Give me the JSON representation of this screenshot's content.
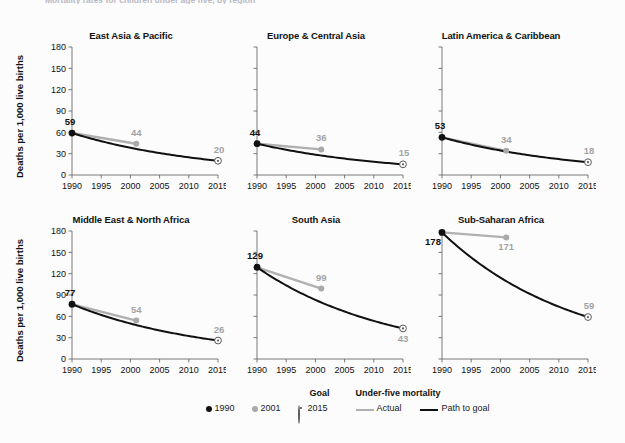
{
  "caption": {
    "partial_text": "Mortality rates for children under age five, by region"
  },
  "axes": {
    "ylabel": "Deaths per 1,000 live births",
    "yticks": [
      "0",
      "30",
      "60",
      "90",
      "120",
      "150",
      "180"
    ],
    "xticks": [
      "1990",
      "1995",
      "2000",
      "2005",
      "2010",
      "2015"
    ],
    "ymin": 0,
    "ymax": 180,
    "xmin": 1990,
    "xmax": 2015
  },
  "legend": {
    "goal_header": "Goal",
    "series_header": "Under-five mortality",
    "marker_1990": "1990",
    "marker_2001": "2001",
    "marker_2015": "2015",
    "line_actual": "Actual",
    "line_path": "Path to goal"
  },
  "colors": {
    "actual": "#b0b0b0",
    "path": "#111111",
    "marker_1990": "#111111",
    "marker_2001": "#a9a9a9",
    "marker_2015": "#5a5a5a",
    "label_gray": "#a3a3a3",
    "label_black": "#111111",
    "axis": "#6b6b6b",
    "background": "#fcfcfc"
  },
  "chart_data": {
    "type": "line",
    "title": "Mortality rates for children under age five, by region",
    "xlabel": "",
    "ylabel": "Deaths per 1,000 live births",
    "xlim": [
      1990,
      2015
    ],
    "ylim": [
      0,
      180
    ],
    "yticks": [
      0,
      30,
      60,
      90,
      120,
      150,
      180
    ],
    "xticks": [
      1990,
      1995,
      2000,
      2005,
      2010,
      2015
    ],
    "grid": false,
    "legend_position": "bottom-center",
    "small_multiples": true,
    "panel_layout": [
      2,
      3
    ],
    "series_definitions": [
      {
        "name": "Actual",
        "color": "#b0b0b0",
        "years": [
          1990,
          2001
        ]
      },
      {
        "name": "Path to goal",
        "color": "#111111",
        "years": [
          1990,
          2015
        ]
      }
    ],
    "marker_definitions": [
      {
        "name": "1990",
        "color": "#111111",
        "style": "filled-circle"
      },
      {
        "name": "2001",
        "color": "#a9a9a9",
        "style": "filled-circle"
      },
      {
        "name": "2015",
        "color": "#5a5a5a",
        "style": "goal-circle"
      }
    ],
    "panels": [
      {
        "title": "East Asia & Pacific",
        "points": [
          {
            "year": 1990,
            "value": 59,
            "label": "59",
            "label_pos": "above-left",
            "marker": "1990"
          },
          {
            "year": 2001,
            "value": 44,
            "label": "44",
            "label_pos": "above",
            "marker": "2001"
          },
          {
            "year": 2015,
            "value": 20,
            "label": "20",
            "label_pos": "above-right",
            "marker": "2015"
          }
        ]
      },
      {
        "title": "Europe & Central Asia",
        "points": [
          {
            "year": 1990,
            "value": 44,
            "label": "44",
            "label_pos": "above-left",
            "marker": "1990"
          },
          {
            "year": 2001,
            "value": 36,
            "label": "36",
            "label_pos": "above",
            "marker": "2001"
          },
          {
            "year": 2015,
            "value": 15,
            "label": "15",
            "label_pos": "above-right",
            "marker": "2015"
          }
        ]
      },
      {
        "title": "Latin America & Caribbean",
        "points": [
          {
            "year": 1990,
            "value": 53,
            "label": "53",
            "label_pos": "above-left",
            "marker": "1990"
          },
          {
            "year": 2001,
            "value": 34,
            "label": "34",
            "label_pos": "above",
            "marker": "2001"
          },
          {
            "year": 2015,
            "value": 18,
            "label": "18",
            "label_pos": "above-right",
            "marker": "2015"
          }
        ]
      },
      {
        "title": "Middle East & North Africa",
        "points": [
          {
            "year": 1990,
            "value": 77,
            "label": "77",
            "label_pos": "above-left",
            "marker": "1990"
          },
          {
            "year": 2001,
            "value": 54,
            "label": "54",
            "label_pos": "above",
            "marker": "2001"
          },
          {
            "year": 2015,
            "value": 26,
            "label": "26",
            "label_pos": "above-right",
            "marker": "2015"
          }
        ]
      },
      {
        "title": "South Asia",
        "points": [
          {
            "year": 1990,
            "value": 129,
            "label": "129",
            "label_pos": "above-left",
            "marker": "1990"
          },
          {
            "year": 2001,
            "value": 99,
            "label": "99",
            "label_pos": "above",
            "marker": "2001"
          },
          {
            "year": 2015,
            "value": 43,
            "label": "43",
            "label_pos": "below-right",
            "marker": "2015"
          }
        ]
      },
      {
        "title": "Sub-Saharan Africa",
        "points": [
          {
            "year": 1990,
            "value": 178,
            "label": "178",
            "label_pos": "below-left",
            "marker": "1990"
          },
          {
            "year": 2001,
            "value": 171,
            "label": "171",
            "label_pos": "below",
            "marker": "2001"
          },
          {
            "year": 2015,
            "value": 59,
            "label": "59",
            "label_pos": "above-right",
            "marker": "2015"
          }
        ]
      }
    ]
  }
}
